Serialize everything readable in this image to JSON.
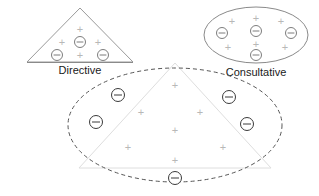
{
  "diagram": {
    "colors": {
      "background": "#ffffff",
      "label_text": "#1a1a1a",
      "plus_symbol": "#b8b8b8",
      "minus_symbol_strong": "#3a3a3a",
      "minus_symbol_faint": "#7d7d7d",
      "solid_outline": "#9a9a9a",
      "dashed_outline": "#555555",
      "faint_outline": "#dedede"
    },
    "groups": [
      {
        "id": "directive",
        "label": "Directive",
        "shape": "triangle",
        "outline_style": "solid",
        "label_x": 80,
        "label_y": 70,
        "symbols": [
          {
            "kind": "plus",
            "x": 80,
            "y": 29
          },
          {
            "kind": "plus",
            "x": 62,
            "y": 42
          },
          {
            "kind": "minus",
            "x": 80,
            "y": 42,
            "tone": "faint"
          },
          {
            "kind": "plus",
            "x": 98,
            "y": 42
          },
          {
            "kind": "minus",
            "x": 57,
            "y": 55,
            "tone": "faint"
          },
          {
            "kind": "plus",
            "x": 80,
            "y": 55
          },
          {
            "kind": "minus",
            "x": 103,
            "y": 55,
            "tone": "faint"
          }
        ]
      },
      {
        "id": "consultative",
        "label": "Consultative",
        "shape": "ellipse",
        "outline_style": "solid",
        "label_x": 256,
        "label_y": 72,
        "symbols": [
          {
            "kind": "plus",
            "x": 232,
            "y": 21
          },
          {
            "kind": "plus",
            "x": 256,
            "y": 18
          },
          {
            "kind": "plus",
            "x": 281,
            "y": 21
          },
          {
            "kind": "minus",
            "x": 222,
            "y": 33,
            "tone": "faint"
          },
          {
            "kind": "minus",
            "x": 256,
            "y": 31,
            "tone": "faint"
          },
          {
            "kind": "minus",
            "x": 291,
            "y": 33,
            "tone": "faint"
          },
          {
            "kind": "plus",
            "x": 228,
            "y": 47
          },
          {
            "kind": "plus",
            "x": 256,
            "y": 44
          },
          {
            "kind": "minus",
            "x": 256,
            "y": 55,
            "tone": "faint"
          },
          {
            "kind": "plus",
            "x": 285,
            "y": 47
          }
        ]
      },
      {
        "id": "participative",
        "label": "",
        "shape": "ellipse-with-triangle",
        "outline_style": "dashed",
        "symbols": [
          {
            "kind": "plus",
            "x": 175,
            "y": 85
          },
          {
            "kind": "minus",
            "x": 118,
            "y": 95,
            "tone": "strong"
          },
          {
            "kind": "minus",
            "x": 229,
            "y": 97,
            "tone": "strong"
          },
          {
            "kind": "plus",
            "x": 141,
            "y": 112
          },
          {
            "kind": "plus",
            "x": 200,
            "y": 112
          },
          {
            "kind": "minus",
            "x": 96,
            "y": 122,
            "tone": "strong"
          },
          {
            "kind": "plus",
            "x": 175,
            "y": 130
          },
          {
            "kind": "minus",
            "x": 247,
            "y": 124,
            "tone": "strong"
          },
          {
            "kind": "plus",
            "x": 128,
            "y": 147
          },
          {
            "kind": "plus",
            "x": 223,
            "y": 147
          },
          {
            "kind": "plus",
            "x": 175,
            "y": 160
          },
          {
            "kind": "minus",
            "x": 175,
            "y": 178,
            "tone": "strong"
          }
        ]
      }
    ]
  }
}
